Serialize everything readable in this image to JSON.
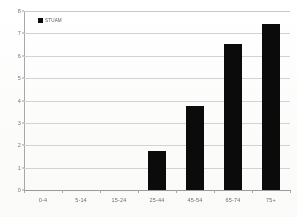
{
  "chart_data": {
    "type": "bar",
    "title": "",
    "xlabel": "",
    "ylabel": "",
    "categories": [
      "0-4",
      "5-14",
      "15-24",
      "25-44",
      "45-54",
      "65-74",
      "75+"
    ],
    "values": [
      0,
      0,
      0,
      1.75,
      3.75,
      6.53,
      7.4
    ],
    "series": [
      {
        "name": "STUAM",
        "values": [
          0,
          0,
          0,
          1.75,
          3.75,
          6.53,
          7.4
        ]
      }
    ],
    "ylim": [
      0,
      8
    ],
    "y_ticks": [
      0,
      1,
      2,
      3,
      4,
      5,
      6,
      7,
      8
    ],
    "y_tick_labels": [
      "0",
      "1",
      "2",
      "3",
      "4",
      "5",
      "6",
      "7",
      "8"
    ],
    "grid": true,
    "grid_axis": "y",
    "legend": {
      "position": "top-left-inside",
      "entries": [
        "STUAM"
      ]
    },
    "colors": {
      "bar": "#0b0b0b",
      "grid": "#d2d2d2",
      "axis": "#a0a0a0",
      "tick_text": "#6f6f6f",
      "background": "#ffffff"
    }
  }
}
